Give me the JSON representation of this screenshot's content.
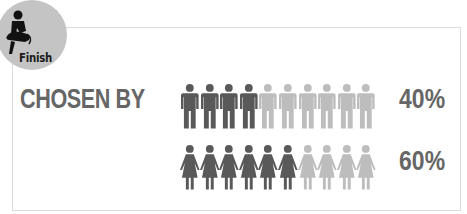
{
  "badge": {
    "label": "Finish",
    "icon": "person-finish-icon",
    "bg_color": "#c4c4c4"
  },
  "title": "CHOSEN BY",
  "colors": {
    "dark": "#595959",
    "light": "#bdbdbd",
    "text": "#666666"
  },
  "rows": [
    {
      "group": "men",
      "icon": "man-icon",
      "total": 10,
      "filled": 4,
      "percent_label": "40%"
    },
    {
      "group": "women",
      "icon": "woman-icon",
      "total": 10,
      "filled": 6,
      "percent_label": "60%"
    }
  ]
}
